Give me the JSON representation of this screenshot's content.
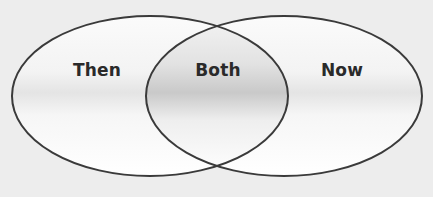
{
  "diagram": {
    "type": "venn",
    "sets": [
      {
        "id": "left",
        "label": "Then",
        "cx": 150,
        "cy": 96,
        "rx": 138,
        "ry": 80,
        "label_x": 97,
        "label_y": 70
      },
      {
        "id": "right",
        "label": "Now",
        "cx": 284,
        "cy": 96,
        "rx": 138,
        "ry": 80,
        "label_x": 342,
        "label_y": 70
      }
    ],
    "intersection": {
      "label": "Both",
      "label_x": 218,
      "label_y": 70
    },
    "colors": {
      "background": "#ededed",
      "fill_light": "#ffffff",
      "fill_band": "#d9d9d9",
      "stroke": "#3a3a3a",
      "text": "#2a2a2a"
    }
  }
}
